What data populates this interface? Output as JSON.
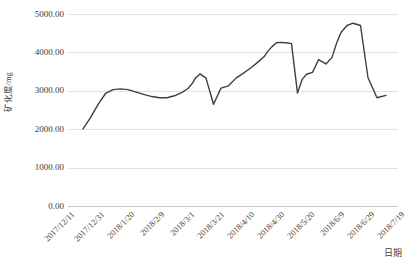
{
  "chart_data": {
    "type": "line",
    "title": "",
    "xlabel": "日期",
    "ylabel": "矿化度/mg",
    "ylim": [
      0,
      5000
    ],
    "ytick_labels": [
      "5000.00",
      "4000.00",
      "3000.00",
      "2000.00",
      "1000.00",
      "0.00"
    ],
    "ytick_values": [
      5000,
      4000,
      3000,
      2000,
      1000,
      0
    ],
    "xtick_labels": [
      "2017/12/11",
      "2017/12/31",
      "2018/1/20",
      "2018/2/9",
      "2018/3/1",
      "2018/3/21",
      "2018/4/10",
      "2018/4/30",
      "2018/5/20",
      "2018/6/9",
      "2018/6/29",
      "2018/7/19"
    ],
    "xlim": [
      "2017/12/11",
      "2018/7/19"
    ],
    "grid": true,
    "legend": false,
    "series": [
      {
        "name": "矿化度",
        "color": "#3f3f3f",
        "x": [
          "2017/12/21",
          "2017/12/26",
          "2017/12/31",
          "2018/1/5",
          "2018/1/10",
          "2018/1/15",
          "2018/1/20",
          "2018/1/26",
          "2018/1/31",
          "2018/2/5",
          "2018/2/10",
          "2018/2/15",
          "2018/2/20",
          "2018/2/25",
          "2018/3/1",
          "2018/3/4",
          "2018/3/6",
          "2018/3/9",
          "2018/3/13",
          "2018/3/18",
          "2018/3/23",
          "2018/3/28",
          "2018/4/2",
          "2018/4/7",
          "2018/4/12",
          "2018/4/17",
          "2018/4/21",
          "2018/4/23",
          "2018/4/26",
          "2018/4/29",
          "2018/5/2",
          "2018/5/5",
          "2018/5/9",
          "2018/5/13",
          "2018/5/16",
          "2018/5/19",
          "2018/5/23",
          "2018/5/27",
          "2018/6/1",
          "2018/6/5",
          "2018/6/8",
          "2018/6/11",
          "2018/6/15",
          "2018/6/19",
          "2018/6/24",
          "2018/6/29",
          "2018/7/5",
          "2018/7/11"
        ],
        "values": [
          2010,
          2300,
          2640,
          2930,
          3030,
          3050,
          3030,
          2960,
          2900,
          2850,
          2820,
          2820,
          2870,
          2960,
          3060,
          3200,
          3330,
          3440,
          3330,
          2650,
          3070,
          3130,
          3330,
          3460,
          3600,
          3760,
          3900,
          4020,
          4150,
          4250,
          4260,
          4250,
          4230,
          2940,
          3290,
          3430,
          3480,
          3810,
          3700,
          3870,
          4230,
          4520,
          4700,
          4760,
          4700,
          3340,
          2820,
          2880
        ]
      }
    ],
    "annotations": []
  },
  "colors": {
    "line": "#3f3f3f",
    "gridline": "#e2e2e2",
    "axis": "#c9c9c9",
    "text": "#404040",
    "background": "#ffffff"
  }
}
